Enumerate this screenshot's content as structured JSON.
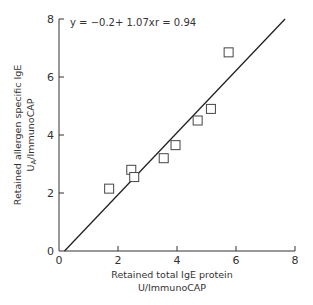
{
  "chart_data": {
    "type": "scatter",
    "title": "",
    "xlabel": "Retained total IgE protein U/ImmunoCAP",
    "xlabel_lines": [
      "Retained total IgE protein",
      "U/ImmunoCAP"
    ],
    "ylabel": "Retained allergen specific IgE UA/ImmunoCAP",
    "ylabel_lines": [
      "Retained allergen specific IgE",
      "U",
      "A",
      "/ImmunoCAP"
    ],
    "xlim": [
      0,
      8
    ],
    "ylim": [
      0,
      8
    ],
    "xticks": [
      0,
      2,
      4,
      6,
      8
    ],
    "yticks": [
      0,
      2,
      4,
      6,
      8
    ],
    "grid": false,
    "legend": null,
    "annotation": {
      "equation": "y = −0.2+ 1.07x",
      "r": "r = 0.94"
    },
    "regression": {
      "intercept": -0.2,
      "slope": 1.07,
      "r": 0.94
    },
    "series": [
      {
        "name": "samples",
        "marker": "open-square",
        "points": [
          {
            "x": 1.7,
            "y": 2.15
          },
          {
            "x": 2.45,
            "y": 2.8
          },
          {
            "x": 2.55,
            "y": 2.55
          },
          {
            "x": 3.55,
            "y": 3.2
          },
          {
            "x": 3.95,
            "y": 3.65
          },
          {
            "x": 4.7,
            "y": 4.5
          },
          {
            "x": 5.15,
            "y": 4.9
          },
          {
            "x": 5.75,
            "y": 6.85
          }
        ]
      }
    ],
    "colors": {
      "axis": "#333333",
      "line": "#222222",
      "marker": "#444444"
    }
  }
}
